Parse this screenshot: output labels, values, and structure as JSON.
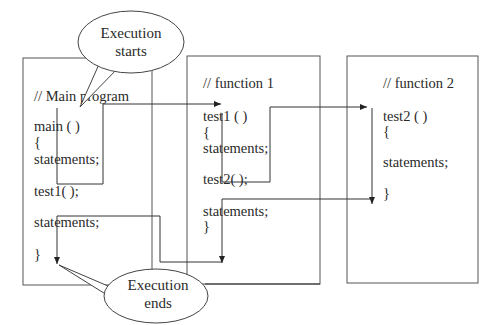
{
  "diagram": {
    "type": "function-call-flow",
    "boxes": [
      {
        "id": "main",
        "lines": [
          "// Main program",
          "main ( )",
          "{",
          "statements;",
          "test1( );",
          "statements;",
          "}"
        ]
      },
      {
        "id": "function1",
        "lines": [
          "// function 1",
          "test1 ( )",
          "{",
          "statements;",
          "test2( );",
          "statements;",
          "}"
        ]
      },
      {
        "id": "function2",
        "lines": [
          "// function 2",
          "test2 ( )",
          "{",
          "statements;",
          "}"
        ]
      }
    ],
    "callouts": {
      "start": [
        "Execution",
        "starts"
      ],
      "end": [
        "Execution",
        "ends"
      ]
    },
    "flows": [
      {
        "from": "main: test1( );",
        "to": "function1: test1 ( )",
        "kind": "call"
      },
      {
        "from": "function1: test2( );",
        "to": "function2: test2 ( )",
        "kind": "call"
      },
      {
        "from": "function2: }",
        "to": "function1: statements;",
        "kind": "return"
      },
      {
        "from": "function1: }",
        "to": "main: }",
        "kind": "return"
      }
    ]
  }
}
